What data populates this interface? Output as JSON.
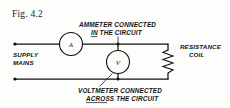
{
  "figure": {
    "label": "Fig. 4.2",
    "title_visible": false
  },
  "diagram": {
    "type": "electrical-circuit-schematic",
    "annotations": {
      "ammeter_caption_line1": "AMMETER CONNECTED",
      "ammeter_caption_line2": "IN THE CIRCUIT",
      "ammeter_caption_underlined_word": "IN",
      "voltmeter_caption_line1": "VOLTMETER CONNECTED",
      "voltmeter_caption_line2": "ACROSS THE CIRCUIT",
      "voltmeter_caption_underlined_word": "ACROSS",
      "supply_label_line1": "SUPPLY",
      "supply_label_line2": "MAINS",
      "load_label_line1": "RESISTANCE",
      "load_label_line2": "COIL"
    },
    "components": [
      {
        "id": "ammeter",
        "symbol": "A",
        "name": "ammeter",
        "connection": "series"
      },
      {
        "id": "voltmeter",
        "symbol": "V",
        "name": "voltmeter",
        "connection": "parallel"
      },
      {
        "id": "resistance-coil",
        "symbol": "zigzag",
        "name": "resistance coil",
        "connection": "load"
      }
    ],
    "colors": {
      "ink": "#111111",
      "paper": "#fdfdfc"
    }
  }
}
